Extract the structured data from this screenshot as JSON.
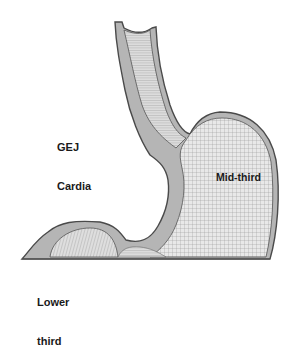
{
  "diagram": {
    "labels": {
      "gej_cardia_line1": "GEJ",
      "gej_cardia_line2": "Cardia",
      "mid_third": "Mid-third",
      "lower_third_line1": "Lower",
      "lower_third_line2": "third"
    },
    "regions": [
      "GEJ Cardia",
      "Mid-third",
      "Lower third"
    ],
    "parts_depicted": [
      "esophagus",
      "fundus",
      "body",
      "antrum",
      "baseline"
    ],
    "colors": {
      "background": "#ffffff",
      "wall_fill": "#b8b8b8",
      "wall_outline": "#555555",
      "mesh_lines": "#8a8a8a",
      "lumen_fill": "#e6e6e6",
      "label_text": "#1a1a1a"
    }
  }
}
